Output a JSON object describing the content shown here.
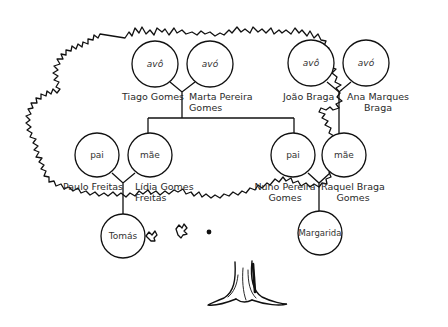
{
  "diagram": {
    "type": "family-tree",
    "colors": {
      "stroke": "#111111",
      "text": "#2a2a2a",
      "background": "#ffffff"
    },
    "grandparents_paternal_side": {
      "grandfather": {
        "role": "avô",
        "name": "Tiago Gomes"
      },
      "grandmother": {
        "role": "avó",
        "name_line1": "Marta Pereira",
        "name_line2": "Gomes"
      }
    },
    "grandparents_maternal_side": {
      "grandfather": {
        "role": "avô",
        "name": "João Braga"
      },
      "grandmother": {
        "role": "avó",
        "name_line1": "Ana Marques",
        "name_line2": "Braga"
      }
    },
    "family_left": {
      "father": {
        "role": "pai",
        "name": "Paulo Freitas"
      },
      "mother": {
        "role": "mãe",
        "name_line1": "Lídia Gomes",
        "name_line2": "Freitas"
      },
      "child": {
        "name": "Tomás"
      }
    },
    "family_right": {
      "father": {
        "role": "pai",
        "name_line1": "Nuno Pereira",
        "name_line2": "Gomes"
      },
      "mother": {
        "role": "mãe",
        "name_line1": "Raquel Braga",
        "name_line2": "Gomes"
      },
      "child": {
        "name": "Margarida"
      }
    }
  }
}
